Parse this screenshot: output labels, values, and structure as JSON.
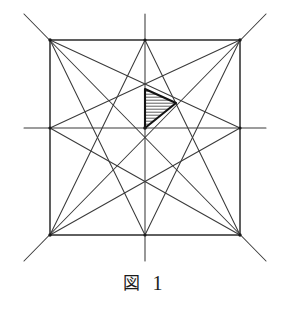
{
  "figure": {
    "caption_label": "図",
    "caption_number": "1",
    "colors": {
      "background": "#ffffff",
      "stroke": "#3a3a3a",
      "stroke_bold": "#1a1a1a",
      "hatch": "#4a4a4a",
      "text": "#1c1c1c"
    },
    "geometry": {
      "square": {
        "left": 50,
        "top": 40,
        "right": 240,
        "bottom": 235
      },
      "center": {
        "x": 145,
        "y": 128
      },
      "corners": [
        {
          "name": "top-left",
          "x": 50,
          "y": 40
        },
        {
          "name": "top-right",
          "x": 240,
          "y": 40
        },
        {
          "name": "bottom-right",
          "x": 240,
          "y": 235
        },
        {
          "name": "bottom-left",
          "x": 50,
          "y": 235
        }
      ],
      "midpoints": [
        {
          "name": "top-mid",
          "x": 145,
          "y": 40
        },
        {
          "name": "right-mid",
          "x": 240,
          "y": 128
        },
        {
          "name": "bottom-mid",
          "x": 145,
          "y": 235
        },
        {
          "name": "left-mid",
          "x": 50,
          "y": 128
        }
      ],
      "extensions": {
        "diag_overshoot": 26,
        "axis_overshoot": 26
      },
      "shaded_triangle": {
        "label": "hatched-triangle",
        "points": [
          {
            "x": 145,
            "y": 89
          },
          {
            "x": 176,
            "y": 103
          },
          {
            "x": 145,
            "y": 128
          }
        ],
        "hatch_angle_deg": 0,
        "hatch_spacing": 3
      }
    },
    "lines": {
      "square_edges": [
        [
          50,
          40,
          240,
          40
        ],
        [
          240,
          40,
          240,
          235
        ],
        [
          240,
          235,
          50,
          235
        ],
        [
          50,
          235,
          50,
          40
        ]
      ],
      "diagonals": [
        [
          24,
          14,
          266,
          261
        ],
        [
          266,
          14,
          24,
          261
        ]
      ],
      "medians": [
        [
          145,
          14,
          145,
          261
        ],
        [
          24,
          128,
          266,
          128
        ]
      ],
      "corner_to_midpoint": [
        [
          50,
          40,
          145,
          235
        ],
        [
          50,
          40,
          240,
          128
        ],
        [
          240,
          40,
          145,
          235
        ],
        [
          240,
          40,
          50,
          128
        ],
        [
          240,
          235,
          145,
          40
        ],
        [
          240,
          235,
          50,
          128
        ],
        [
          50,
          235,
          145,
          40
        ],
        [
          50,
          235,
          240,
          128
        ]
      ]
    }
  }
}
